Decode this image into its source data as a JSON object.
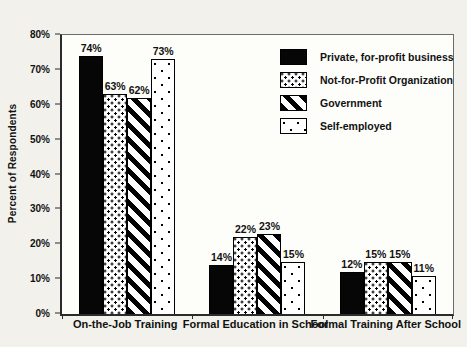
{
  "figure": {
    "background": "#f2f1ec",
    "plot_background": "#fdfdfa",
    "bar_outline_color": "#000000",
    "solid_bar_color": "#060606"
  },
  "chart_data": {
    "type": "bar",
    "title": "",
    "xlabel": "",
    "ylabel": "Percent of Respondents",
    "ylim": [
      0,
      80
    ],
    "ytick_labels": [
      "0%",
      "10%",
      "20%",
      "30%",
      "40%",
      "50%",
      "60%",
      "70%",
      "80%"
    ],
    "grid": false,
    "legend_position": "inside-top-right",
    "categories": [
      "On-the-Job Training",
      "Formal Education in School",
      "Formal Training After School"
    ],
    "series": [
      {
        "name": "Private, for-profit business",
        "pattern": "solid",
        "values": [
          74,
          14,
          12
        ]
      },
      {
        "name": "Not-for-Profit Organization",
        "pattern": "dots-dense",
        "values": [
          63,
          22,
          15
        ]
      },
      {
        "name": "Government",
        "pattern": "hatch",
        "values": [
          62,
          23,
          15
        ]
      },
      {
        "name": "Self-employed",
        "pattern": "dots-sparse",
        "values": [
          73,
          15,
          11
        ]
      }
    ],
    "bar_value_labels": [
      [
        "74%",
        "63%",
        "62%",
        "73%"
      ],
      [
        "14%",
        "22%",
        "23%",
        "15%"
      ],
      [
        "12%",
        "15%",
        "15%",
        "11%"
      ]
    ]
  }
}
